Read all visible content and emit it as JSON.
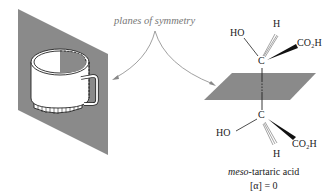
{
  "annotation": {
    "text": "planes of symmetry"
  },
  "molecule": {
    "name_prefix": "meso",
    "name_rest": "-tartaric acid",
    "rotation": "[α] = 0",
    "upper_carbon": {
      "center": "C",
      "substituents": {
        "left": "HO",
        "top": "H",
        "right": "CO₂H"
      }
    },
    "lower_carbon": {
      "center": "C",
      "substituents": {
        "left": "HO",
        "bottom": "H",
        "right": "CO₂H"
      }
    }
  },
  "colors": {
    "plane": "#8a8a8a",
    "arrow": "#888888",
    "text": "#222222",
    "annotation_text": "#777777"
  }
}
